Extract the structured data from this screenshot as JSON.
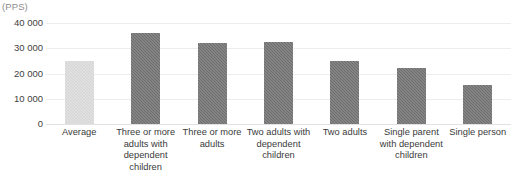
{
  "unit_label": "(PPS)",
  "axis": {
    "y_ticks": [
      "40 000",
      "30 000",
      "20 000",
      "10 000",
      "0"
    ]
  },
  "chart_data": {
    "type": "bar",
    "title": "",
    "xlabel": "",
    "ylabel": "(PPS)",
    "ylim": [
      0,
      40000
    ],
    "ytick_values": [
      40000,
      30000,
      20000,
      10000,
      0
    ],
    "ytick_labels": [
      "40 000",
      "30 000",
      "20 000",
      "10 000",
      "0"
    ],
    "grid": true,
    "legend": false,
    "categories": [
      "Average",
      "Three or more adults with dependent children",
      "Three or more adults",
      "Two adults with dependent children",
      "Two adults",
      "Single parent with dependent children",
      "Single person"
    ],
    "values": [
      24800,
      36000,
      32200,
      32300,
      25000,
      22000,
      15500
    ],
    "colors": [
      "#d4d4d4",
      "#6d6d6d",
      "#6d6d6d",
      "#6d6d6d",
      "#6d6d6d",
      "#6d6d6d",
      "#6d6d6d"
    ]
  },
  "bars": [
    {
      "label": "Average",
      "label_lines": [
        "Average"
      ],
      "value": 24800,
      "highlight": true
    },
    {
      "label": "Three or more adults with dependent children",
      "label_lines": [
        "Three or more",
        "adults with",
        "dependent",
        "children"
      ],
      "value": 36000,
      "highlight": false
    },
    {
      "label": "Three or more adults",
      "label_lines": [
        "Three or more",
        "adults"
      ],
      "value": 32200,
      "highlight": false
    },
    {
      "label": "Two adults with dependent children",
      "label_lines": [
        "Two adults with",
        "dependent",
        "children"
      ],
      "value": 32300,
      "highlight": false
    },
    {
      "label": "Two adults",
      "label_lines": [
        "Two adults"
      ],
      "value": 25000,
      "highlight": false
    },
    {
      "label": "Single parent with dependent children",
      "label_lines": [
        "Single parent",
        "with dependent",
        "children"
      ],
      "value": 22000,
      "highlight": false
    },
    {
      "label": "Single person",
      "label_lines": [
        "Single person"
      ],
      "value": 15500,
      "highlight": false
    }
  ]
}
